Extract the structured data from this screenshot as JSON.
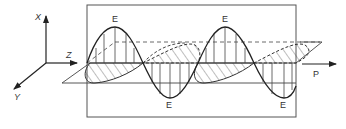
{
  "diagram": {
    "axes": {
      "x_label": "X",
      "y_label": "Y",
      "z_label": "Z"
    },
    "labels": {
      "e_crest_1": "E",
      "e_crest_2": "E",
      "e_trough_1": "E",
      "e_trough_2": "E",
      "propagation": "P"
    },
    "colors": {
      "stroke": "#333333",
      "frame": "#555555",
      "background": "#ffffff"
    }
  }
}
